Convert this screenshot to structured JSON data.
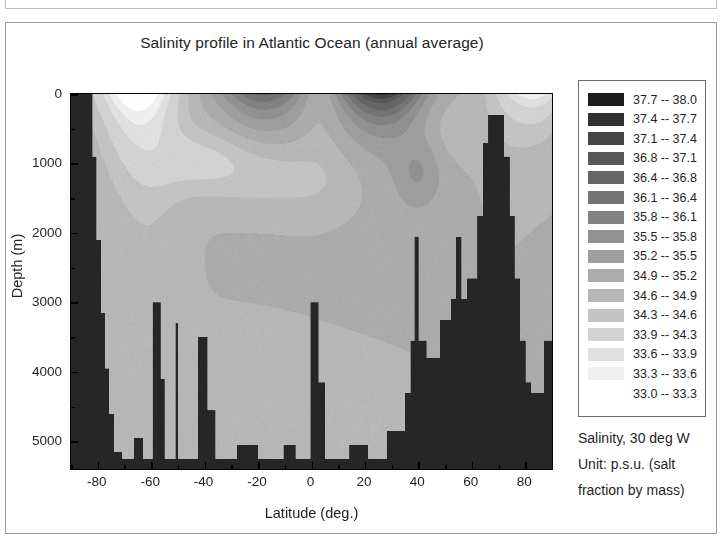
{
  "chart_data": {
    "type": "heatmap",
    "title": "Salinity profile in Atlantic Ocean (annual average)",
    "xlabel": "Latitude (deg.)",
    "ylabel": "Depth (m)",
    "xlim": [
      -90,
      90
    ],
    "ylim": [
      5400,
      0
    ],
    "y_inverted": true,
    "grid": false,
    "xticks": [
      -80,
      -60,
      -40,
      -20,
      0,
      20,
      40,
      60,
      80
    ],
    "xticklabels": [
      "-80",
      "-60",
      "-40",
      "-20",
      "0",
      "20",
      "40",
      "60",
      "80"
    ],
    "xminor_step": 10,
    "yticks": [
      0,
      1000,
      2000,
      3000,
      4000,
      5000
    ],
    "yticklabels": [
      "0",
      "1000",
      "2000",
      "3000",
      "4000",
      "5000"
    ],
    "yminor_step": 500,
    "units": "p.s.u.",
    "variable": "Salinity",
    "section_longitude": "30 deg W",
    "legend_position": "right",
    "colormap": "grayscale-discrete-16",
    "landmask_color": "#262626",
    "levels": [
      33.0,
      33.3,
      33.6,
      33.9,
      34.3,
      34.6,
      34.9,
      35.2,
      35.5,
      35.8,
      36.1,
      36.4,
      36.8,
      37.1,
      37.4,
      37.7,
      38.0
    ],
    "legend_entries": [
      {
        "low": "37.7",
        "high": "38.0",
        "label": "37.7 -- 38.0",
        "color": "#1c1c1c"
      },
      {
        "low": "37.4",
        "high": "37.7",
        "label": "37.4 -- 37.7",
        "color": "#303030"
      },
      {
        "low": "37.1",
        "high": "37.4",
        "label": "37.1 -- 37.4",
        "color": "#454545"
      },
      {
        "low": "36.8",
        "high": "37.1",
        "label": "36.8 -- 37.1",
        "color": "#585858"
      },
      {
        "low": "36.4",
        "high": "36.8",
        "label": "36.4 -- 36.8",
        "color": "#666666"
      },
      {
        "low": "36.1",
        "high": "36.4",
        "label": "36.1 -- 36.4",
        "color": "#747474"
      },
      {
        "low": "35.8",
        "high": "36.1",
        "label": "35.8 -- 36.1",
        "color": "#828282"
      },
      {
        "low": "35.5",
        "high": "35.8",
        "label": "35.5 -- 35.8",
        "color": "#919191"
      },
      {
        "low": "35.2",
        "high": "35.5",
        "label": "35.2 -- 35.5",
        "color": "#9e9e9e"
      },
      {
        "low": "34.9",
        "high": "35.2",
        "label": "34.9 -- 35.2",
        "color": "#ababab"
      },
      {
        "low": "34.6",
        "high": "34.9",
        "label": "34.6 -- 34.9",
        "color": "#b7b7b7"
      },
      {
        "low": "34.3",
        "high": "34.6",
        "label": "34.3 -- 34.6",
        "color": "#c3c3c3"
      },
      {
        "low": "33.9",
        "high": "34.3",
        "label": "33.9 -- 34.3",
        "color": "#d2d2d2"
      },
      {
        "low": "33.6",
        "high": "33.9",
        "label": "33.6 -- 33.9",
        "color": "#e0e0e0"
      },
      {
        "low": "33.3",
        "high": "33.6",
        "label": "33.3 -- 33.6",
        "color": "#efefef"
      },
      {
        "low": "33.0",
        "high": "33.3",
        "label": "33.0 -- 33.3",
        "color": "#ffffff"
      }
    ],
    "bathymetry": [
      {
        "lat": -90,
        "depth": 0
      },
      {
        "lat": -84,
        "depth": 0
      },
      {
        "lat": -82,
        "depth": 900
      },
      {
        "lat": -80.5,
        "depth": 2100
      },
      {
        "lat": -79,
        "depth": 3150
      },
      {
        "lat": -77.5,
        "depth": 3950
      },
      {
        "lat": -76,
        "depth": 4600
      },
      {
        "lat": -74,
        "depth": 5150
      },
      {
        "lat": -71,
        "depth": 5250
      },
      {
        "lat": -68,
        "depth": 5250
      },
      {
        "lat": -66.5,
        "depth": 4950
      },
      {
        "lat": -64.5,
        "depth": 4950
      },
      {
        "lat": -63,
        "depth": 5250
      },
      {
        "lat": -60.5,
        "depth": 5250
      },
      {
        "lat": -59.5,
        "depth": 3000
      },
      {
        "lat": -58,
        "depth": 3000
      },
      {
        "lat": -56.5,
        "depth": 4100
      },
      {
        "lat": -55,
        "depth": 5250
      },
      {
        "lat": -52,
        "depth": 5250
      },
      {
        "lat": -51,
        "depth": 3300
      },
      {
        "lat": -50,
        "depth": 5250
      },
      {
        "lat": -44,
        "depth": 5250
      },
      {
        "lat": -42.5,
        "depth": 3500
      },
      {
        "lat": -41,
        "depth": 3500
      },
      {
        "lat": -39,
        "depth": 4550
      },
      {
        "lat": -36,
        "depth": 5250
      },
      {
        "lat": -30,
        "depth": 5250
      },
      {
        "lat": -28,
        "depth": 5050
      },
      {
        "lat": -22,
        "depth": 5050
      },
      {
        "lat": -20,
        "depth": 5250
      },
      {
        "lat": -12,
        "depth": 5250
      },
      {
        "lat": -10.5,
        "depth": 5050
      },
      {
        "lat": -8,
        "depth": 5050
      },
      {
        "lat": -6,
        "depth": 5250
      },
      {
        "lat": -2,
        "depth": 5250
      },
      {
        "lat": -0.5,
        "depth": 3000
      },
      {
        "lat": 1,
        "depth": 3000
      },
      {
        "lat": 2.5,
        "depth": 4150
      },
      {
        "lat": 5,
        "depth": 5250
      },
      {
        "lat": 12,
        "depth": 5250
      },
      {
        "lat": 14,
        "depth": 5050
      },
      {
        "lat": 19,
        "depth": 5050
      },
      {
        "lat": 21,
        "depth": 5250
      },
      {
        "lat": 26,
        "depth": 5250
      },
      {
        "lat": 28,
        "depth": 4850
      },
      {
        "lat": 33,
        "depth": 4850
      },
      {
        "lat": 35,
        "depth": 4300
      },
      {
        "lat": 37,
        "depth": 3550
      },
      {
        "lat": 38.5,
        "depth": 2050
      },
      {
        "lat": 40,
        "depth": 3550
      },
      {
        "lat": 43,
        "depth": 3800
      },
      {
        "lat": 46,
        "depth": 3800
      },
      {
        "lat": 48,
        "depth": 3250
      },
      {
        "lat": 50,
        "depth": 3250
      },
      {
        "lat": 52,
        "depth": 2950
      },
      {
        "lat": 54,
        "depth": 2050
      },
      {
        "lat": 56,
        "depth": 2950
      },
      {
        "lat": 58,
        "depth": 2650
      },
      {
        "lat": 60,
        "depth": 2650
      },
      {
        "lat": 62,
        "depth": 1750
      },
      {
        "lat": 64,
        "depth": 700
      },
      {
        "lat": 66,
        "depth": 300
      },
      {
        "lat": 70,
        "depth": 300
      },
      {
        "lat": 72,
        "depth": 900
      },
      {
        "lat": 74,
        "depth": 1750
      },
      {
        "lat": 76,
        "depth": 2650
      },
      {
        "lat": 78,
        "depth": 3550
      },
      {
        "lat": 80,
        "depth": 4150
      },
      {
        "lat": 82,
        "depth": 4300
      },
      {
        "lat": 85,
        "depth": 4300
      },
      {
        "lat": 87,
        "depth": 3550
      },
      {
        "lat": 90,
        "depth": 3550
      }
    ],
    "water_masses": [
      {
        "name": "Antarctic surface low-salinity",
        "lat_range": [
          -78,
          -55
        ],
        "depth_range": [
          0,
          600
        ],
        "salinity": 33.9
      },
      {
        "name": "South Atlantic subtropical maximum",
        "lat_range": [
          -30,
          -10
        ],
        "depth_range": [
          0,
          300
        ],
        "salinity": 36.4
      },
      {
        "name": "Antarctic Intermediate Water",
        "lat_range": [
          -55,
          -20
        ],
        "depth_range": [
          600,
          1400
        ],
        "salinity": 34.3
      },
      {
        "name": "North Atlantic subtropical maximum",
        "lat_range": [
          15,
          42
        ],
        "depth_range": [
          0,
          600
        ],
        "salinity": 37.4
      },
      {
        "name": "Mediterranean Outflow",
        "lat_range": [
          32,
          44
        ],
        "depth_range": [
          800,
          1500
        ],
        "salinity": 36.1
      },
      {
        "name": "North Atlantic Deep Water",
        "lat_range": [
          -40,
          60
        ],
        "depth_range": [
          1500,
          4000
        ],
        "salinity": 34.9
      },
      {
        "name": "Arctic low-salinity surface",
        "lat_range": [
          72,
          90
        ],
        "depth_range": [
          0,
          400
        ],
        "salinity": 33.6
      },
      {
        "name": "Antarctic Bottom Water",
        "lat_range": [
          -70,
          10
        ],
        "depth_range": [
          4000,
          5200
        ],
        "salinity": 34.6
      }
    ]
  },
  "caption": {
    "line1": "Salinity, 30 deg W",
    "line2": "Unit: p.s.u. (salt",
    "line3": "fraction by mass)"
  }
}
